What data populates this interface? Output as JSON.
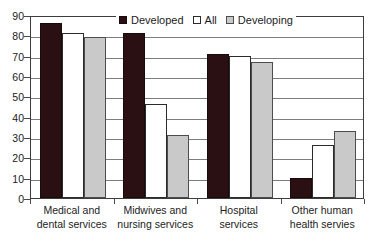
{
  "chart_data": {
    "type": "bar",
    "title": "",
    "subtitle": "",
    "xlabel": "",
    "ylabel": "",
    "ylim": [
      0,
      90
    ],
    "ytick_step": 10,
    "yticks": [
      "90",
      "80",
      "70",
      "60",
      "50",
      "40",
      "30",
      "20",
      "10",
      "0"
    ],
    "grid": true,
    "grid_axis": "y",
    "legend_position": "top-center",
    "categories": [
      "Medical and dental services",
      "Midwives and nursing services",
      "Hospital services",
      "Other human health servies"
    ],
    "category_lines": [
      [
        "Medical and",
        "dental services"
      ],
      [
        "Midwives and",
        "nursing services"
      ],
      [
        "Hospital",
        "services"
      ],
      [
        "Other human",
        "health servies"
      ]
    ],
    "series": [
      {
        "name": "Developed",
        "color": "#2a1012",
        "values": [
          86,
          81,
          71,
          10
        ]
      },
      {
        "name": "All",
        "color": "#ffffff",
        "values": [
          81,
          46,
          70,
          26
        ]
      },
      {
        "name": "Developing",
        "color": "#c9c9c9",
        "values": [
          79,
          31,
          67,
          33
        ]
      }
    ],
    "legend": [
      {
        "label": "Developed",
        "swatch": "#2a1012",
        "icon": "filled-square-icon"
      },
      {
        "label": "All",
        "swatch": "#ffffff",
        "icon": "empty-square-icon"
      },
      {
        "label": "Developing",
        "swatch": "#c9c9c9",
        "icon": "gray-square-icon"
      }
    ]
  }
}
